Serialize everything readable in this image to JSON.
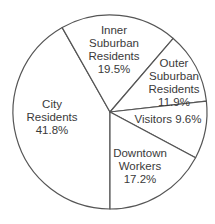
{
  "chart_data": {
    "type": "pie",
    "title": "",
    "start_angle_deg": 180,
    "direction": "clockwise-from-bottom",
    "slices": [
      {
        "label": "City Residents",
        "value": 41.8,
        "display": "41.8%"
      },
      {
        "label": "Inner Suburban Residents",
        "value": 19.5,
        "display": "19.5%"
      },
      {
        "label": "Outer Suburban Residents",
        "value": 11.9,
        "display": "11.9%"
      },
      {
        "label": "Visitors",
        "value": 9.6,
        "display": "9.6%"
      },
      {
        "label": "Downtown Workers",
        "value": 17.2,
        "display": "17.2%"
      }
    ],
    "colors": {
      "fill": "#ffffff",
      "stroke": "#555555",
      "text": "#3a3a3a"
    }
  },
  "labels": {
    "city": {
      "line1": "City",
      "line2": "Residents",
      "line3": "41.8%"
    },
    "inner": {
      "line1": "Inner",
      "line2": "Suburban",
      "line3": "Residents",
      "line4": "19.5%"
    },
    "outer": {
      "line1": "Outer",
      "line2": "Suburban",
      "line3": "Residents",
      "line4": "11.9%"
    },
    "visitors": {
      "line1": "Visitors 9.6%"
    },
    "downtown": {
      "line1": "Downtown",
      "line2": "Workers",
      "line3": "17.2%"
    }
  }
}
